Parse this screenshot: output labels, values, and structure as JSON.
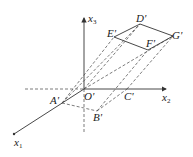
{
  "diagram": {
    "type": "oblique projection of parallelepiped on 3D axes",
    "axes": {
      "x1": {
        "label": "x",
        "sub": "1"
      },
      "x2": {
        "label": "x",
        "sub": "2"
      },
      "x3": {
        "label": "x",
        "sub": "3"
      }
    },
    "points": {
      "O": "O'",
      "A": "A'",
      "B": "B'",
      "C": "C'",
      "D": "D'",
      "E": "E'",
      "F": "F'",
      "G": "G'"
    },
    "colors": {
      "line": "#333333",
      "text": "#222222",
      "background": "#ffffff"
    }
  }
}
